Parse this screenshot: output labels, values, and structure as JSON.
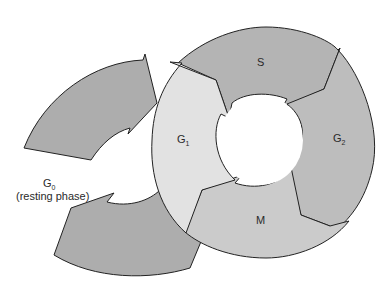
{
  "diagram": {
    "type": "cell-cycle",
    "phases": [
      {
        "id": "G1",
        "label": "G",
        "subscript": "1",
        "color": "#e2e2e2"
      },
      {
        "id": "S",
        "label": "S",
        "subscript": "",
        "color": "#b4b4b4"
      },
      {
        "id": "G2",
        "label": "G",
        "subscript": "2",
        "color": "#bdbdbd"
      },
      {
        "id": "M",
        "label": "M",
        "subscript": "",
        "color": "#cbcbcb"
      }
    ],
    "g0": {
      "label": "G",
      "subscript": "0",
      "caption": "(resting phase)",
      "color": "#adadad"
    },
    "outline_color": "#222222"
  }
}
